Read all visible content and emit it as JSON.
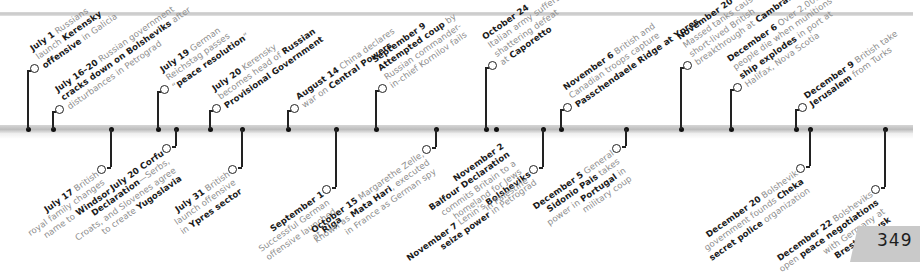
{
  "page_number": "349",
  "timeline": {
    "band_color": "#c4c4c4",
    "events_above": [
      {
        "x": 28,
        "ring_y": 66,
        "parts": [
          [
            {
              "b": "July 1"
            },
            {
              "t": " Russians"
            }
          ],
          [
            {
              "t": "launch "
            },
            {
              "b": "Kerensky"
            }
          ],
          [
            {
              "b": "offensive"
            },
            {
              "t": " in Galicia"
            }
          ]
        ]
      },
      {
        "x": 53,
        "ring_y": 107,
        "parts": [
          [
            {
              "b": "July 16–20"
            },
            {
              "t": " Russian government"
            }
          ],
          [
            {
              "b": "cracks down on Bolsheviks"
            },
            {
              "t": " after"
            }
          ],
          [
            {
              "t": "disturbances in Petrograd"
            }
          ]
        ]
      },
      {
        "x": 158,
        "ring_y": 87,
        "parts": [
          [
            {
              "b": "July 19"
            },
            {
              "t": " German"
            }
          ],
          [
            {
              "t": "Reichstag passes"
            }
          ],
          [
            {
              "t": "“"
            },
            {
              "b": "peace resolution"
            },
            {
              "t": "”"
            }
          ]
        ]
      },
      {
        "x": 210,
        "ring_y": 106,
        "parts": [
          [
            {
              "b": "July 20"
            },
            {
              "t": " Kerensky"
            }
          ],
          [
            {
              "t": "becomes head of "
            },
            {
              "b": "Russian"
            }
          ],
          [
            {
              "b": "Provisional Government"
            }
          ]
        ]
      },
      {
        "x": 288,
        "ring_y": 106,
        "parts": [
          [
            {
              "b": "August 14"
            },
            {
              "t": " China declares"
            }
          ],
          [
            {
              "t": "war on "
            },
            {
              "b": "Central Powers"
            }
          ]
        ]
      },
      {
        "x": 376,
        "ring_y": 86,
        "parts": [
          [
            {
              "b": "September 9"
            }
          ],
          [
            {
              "b": "Attempted coup"
            },
            {
              "t": " by"
            }
          ],
          [
            {
              "t": "Russian commander-"
            }
          ],
          [
            {
              "t": "in-chief Kornilov fails"
            }
          ]
        ]
      },
      {
        "x": 486,
        "ring_y": 63,
        "parts": [
          [
            {
              "b": "October 24"
            }
          ],
          [
            {
              "t": "Italian army suffers"
            }
          ],
          [
            {
              "t": "shattering defeat"
            }
          ],
          [
            {
              "t": "at "
            },
            {
              "b": "Caporetto"
            }
          ]
        ]
      },
      {
        "x": 561,
        "ring_y": 105,
        "parts": [
          [
            {
              "b": "November 6"
            },
            {
              "t": " British and"
            }
          ],
          [
            {
              "t": "Canadian troops capture"
            }
          ],
          [
            {
              "b": "Passchendaele Ridge at Ypres"
            }
          ]
        ]
      },
      {
        "x": 681,
        "ring_y": 63,
        "parts": [
          [
            {
              "b": "November 20"
            }
          ],
          [
            {
              "t": "Massed tanks cause"
            }
          ],
          [
            {
              "t": "short-lived British"
            }
          ],
          [
            {
              "t": "breakthrough at "
            },
            {
              "b": "Cambrai"
            }
          ]
        ]
      },
      {
        "x": 731,
        "ring_y": 85,
        "parts": [
          [
            {
              "b": "December 6"
            },
            {
              "t": " Over 2,000"
            }
          ],
          [
            {
              "t": "people die when munitions"
            }
          ],
          [
            {
              "b": "ship explodes"
            },
            {
              "t": " in port at"
            }
          ],
          [
            {
              "t": "Halifax, Nova Scotia"
            }
          ]
        ]
      },
      {
        "x": 796,
        "ring_y": 105,
        "parts": [
          [
            {
              "b": "December 9"
            },
            {
              "t": " British take"
            }
          ],
          [
            {
              "b": "Jerusalem"
            },
            {
              "t": " from Turks"
            }
          ]
        ]
      }
    ],
    "events_below": [
      {
        "x": 111,
        "ring_y": 167,
        "parts": [
          [
            {
              "b": "July 17"
            },
            {
              "t": " British"
            }
          ],
          [
            {
              "t": "royal family changes"
            }
          ],
          [
            {
              "t": "name to "
            },
            {
              "b": "Windsor"
            }
          ]
        ]
      },
      {
        "x": 176,
        "ring_y": 146,
        "parts": [
          [
            {
              "b": "July 20 Corfu"
            }
          ],
          [
            {
              "b": "Declaration"
            },
            {
              "t": "—Serbs,"
            }
          ],
          [
            {
              "t": "Croats, and Slovenes agree"
            }
          ],
          [
            {
              "t": "to create "
            },
            {
              "b": "Yugoslavia"
            }
          ]
        ]
      },
      {
        "x": 242,
        "ring_y": 167,
        "parts": [
          [
            {
              "b": "July 31"
            },
            {
              "t": " British"
            }
          ],
          [
            {
              "t": "launch offensive"
            }
          ],
          [
            {
              "t": "in "
            },
            {
              "b": "Ypres sector"
            }
          ]
        ]
      },
      {
        "x": 336,
        "ring_y": 187,
        "parts": [
          [
            {
              "b": "September 1"
            }
          ],
          [
            {
              "t": "Successful German"
            }
          ],
          [
            {
              "t": "offensive launched"
            }
          ],
          [
            {
              "t": "at "
            },
            {
              "b": "Riga"
            }
          ]
        ]
      },
      {
        "x": 436,
        "ring_y": 147,
        "parts": [
          [
            {
              "b": "October 15"
            },
            {
              "t": " Margarethe Zelle,"
            }
          ],
          [
            {
              "t": "known as "
            },
            {
              "b": "Mata Hari"
            },
            {
              "t": ", executed"
            }
          ],
          [
            {
              "t": "in France as German spy"
            }
          ]
        ]
      },
      {
        "x": 543,
        "ring_y": 167,
        "parts": [
          [
            {
              "b": "November 7"
            },
            {
              "t": " Lenin’s "
            },
            {
              "b": "Bolsheviks"
            }
          ],
          [
            {
              "b": "seize power"
            },
            {
              "t": " in Petrograd"
            }
          ]
        ]
      },
      {
        "x": 626,
        "ring_y": 146,
        "parts": [
          [
            {
              "b": "December 5"
            },
            {
              "t": " General"
            }
          ],
          [
            {
              "b": "Sidonio Pais"
            },
            {
              "t": " takes"
            }
          ],
          [
            {
              "t": "power in "
            },
            {
              "b": "Portugal"
            },
            {
              "t": " in"
            }
          ],
          [
            {
              "t": "military coup"
            }
          ]
        ]
      },
      {
        "x": 810,
        "ring_y": 166,
        "parts": [
          [
            {
              "b": "December 20"
            },
            {
              "t": " Bolshevik"
            }
          ],
          [
            {
              "t": "government founds "
            },
            {
              "b": "Cheka"
            }
          ],
          [
            {
              "b": "secret police"
            },
            {
              "t": " organization"
            }
          ]
        ]
      },
      {
        "x": 885,
        "ring_y": 187,
        "parts": [
          [
            {
              "b": "December 22"
            },
            {
              "t": " Bolsheviks"
            }
          ],
          [
            {
              "t": "open "
            },
            {
              "b": "peace negotiations"
            }
          ],
          [
            {
              "t": "with Germany at"
            }
          ],
          [
            {
              "b": "Brest–Litovsk"
            }
          ]
        ]
      }
    ],
    "extra_dots_above": [],
    "extra_dots_below": [],
    "below_special": [
      {
        "x": 496,
        "parts": [
          [
            {
              "b": "November 2"
            }
          ],
          [
            {
              "b": "Balfour Declaration"
            }
          ],
          [
            {
              "t": "commits Britain to a"
            }
          ],
          [
            {
              "t": "homeland for Jews"
            }
          ],
          [
            {
              "t": "in Palestine"
            }
          ]
        ]
      }
    ]
  }
}
